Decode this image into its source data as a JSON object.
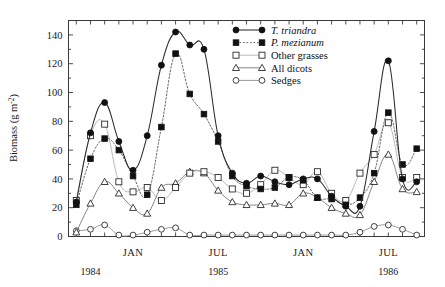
{
  "figure": {
    "background": "#ffffff",
    "frame_color": "#3a3a3a"
  },
  "chart_data": {
    "type": "line",
    "title": "",
    "xlabel": "",
    "ylabel": "Biomass (g m⁻²)",
    "ylim": [
      0,
      150
    ],
    "yticks": [
      0,
      20,
      40,
      60,
      80,
      100,
      120,
      140
    ],
    "ytick_labels": [
      "0",
      "20",
      "40",
      "60",
      "80",
      "100",
      "120",
      "140"
    ],
    "grid": false,
    "legend_position": "top-right",
    "x_axis": {
      "type": "time",
      "n_points": 25,
      "tick_interval": "month",
      "month_labels": [
        {
          "label": "JAN",
          "index": 4
        },
        {
          "label": "JUL",
          "index": 10
        },
        {
          "label": "JAN",
          "index": 16
        },
        {
          "label": "JUL",
          "index": 22
        }
      ],
      "year_labels": [
        {
          "label": "1984",
          "index": 1
        },
        {
          "label": "1985",
          "index": 10
        },
        {
          "label": "1986",
          "index": 22
        }
      ]
    },
    "x": [
      0,
      1,
      2,
      3,
      4,
      5,
      6,
      7,
      8,
      9,
      10,
      11,
      12,
      13,
      14,
      15,
      16,
      17,
      18,
      19,
      20,
      21,
      22,
      23,
      24
    ],
    "series": [
      {
        "name": "T. triandra",
        "italic": true,
        "marker": "filled-circle",
        "line_style": "solid",
        "line_color": "#2b2b2b",
        "marker_color": "#111111",
        "values": [
          24,
          72,
          93,
          66,
          46,
          70,
          119,
          142,
          133,
          130,
          70,
          44,
          37,
          42,
          38,
          36,
          40,
          40,
          28,
          21,
          21,
          73,
          122,
          40,
          38
        ]
      },
      {
        "name": "P. mezianum",
        "italic": true,
        "marker": "filled-square",
        "line_style": "dotted",
        "line_color": "#555555",
        "marker_color": "#111111",
        "values": [
          22,
          54,
          68,
          60,
          42,
          29,
          76,
          127,
          99,
          85,
          66,
          42,
          35,
          33,
          34,
          41,
          39,
          27,
          26,
          22,
          27,
          44,
          86,
          50,
          61
        ]
      },
      {
        "name": "Other grasses",
        "italic": false,
        "marker": "open-square",
        "line_style": "light",
        "line_color": "#b9b9b9",
        "marker_color": "#2b2b2b",
        "values": [
          25,
          70,
          78,
          38,
          31,
          34,
          25,
          34,
          44,
          45,
          41,
          33,
          30,
          36,
          46,
          41,
          36,
          45,
          30,
          25,
          44,
          57,
          79,
          41,
          41
        ]
      },
      {
        "name": "All dicots",
        "italic": false,
        "marker": "open-triangle",
        "line_style": "solid-thin",
        "line_color": "#6e6e6e",
        "marker_color": "#2b2b2b",
        "values": [
          3,
          23,
          38,
          30,
          20,
          16,
          34,
          37,
          45,
          44,
          32,
          24,
          22,
          22,
          23,
          22,
          30,
          27,
          20,
          16,
          15,
          38,
          57,
          33,
          31
        ]
      },
      {
        "name": "Sedges",
        "italic": false,
        "marker": "open-circle",
        "line_style": "solid-thin",
        "line_color": "#8a8a8a",
        "marker_color": "#2b2b2b",
        "values": [
          4,
          5,
          8,
          1,
          1,
          3,
          5,
          6,
          1,
          1,
          1,
          1,
          1,
          1,
          1,
          1,
          1,
          1,
          1,
          1,
          3,
          7,
          8,
          5,
          1
        ]
      }
    ]
  }
}
